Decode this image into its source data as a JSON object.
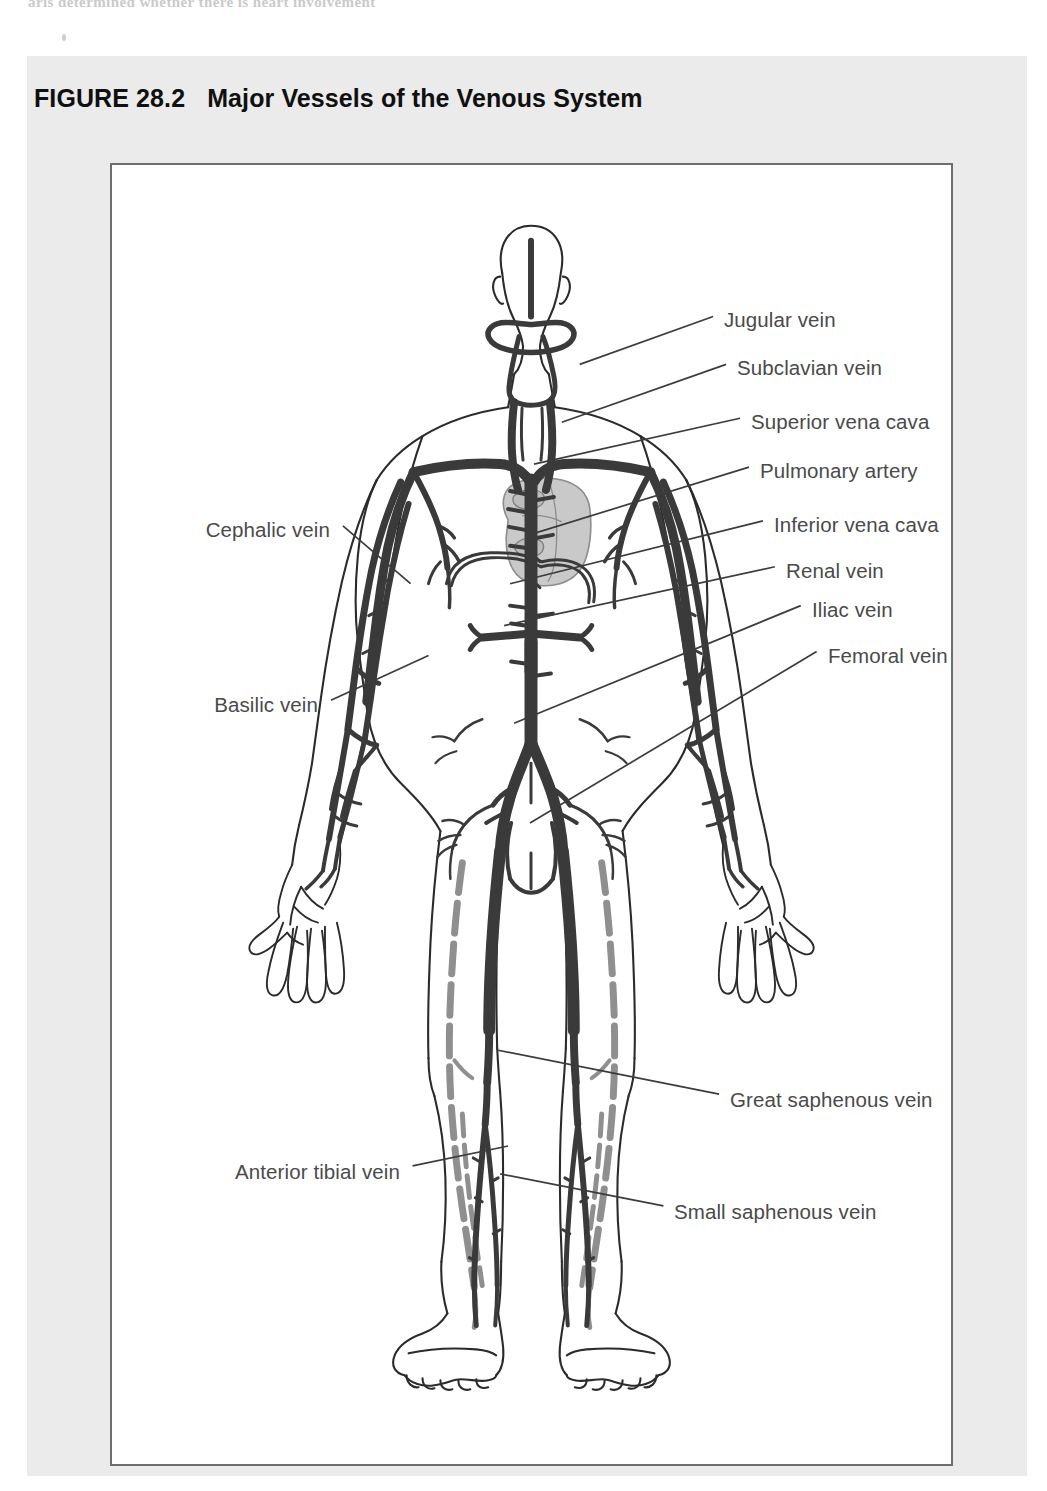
{
  "page": {
    "bleed_text": "aris determined whether there is heart involvement",
    "panel_bg": "#ebebeb",
    "art_bg": "#ffffff",
    "frame_color": "#6e6e6e"
  },
  "figure": {
    "number": "FIGURE 28.2",
    "title": "Major Vessels of the Venous System",
    "title_color": "#101010"
  },
  "diagram": {
    "vein_color": "#3a3a3a",
    "superficial_vein_color": "#8f8f8f",
    "outline_color": "#2b2b2b",
    "heart_fill": "#c9c9c9",
    "leader_color": "#3c3c3c",
    "labels_right": [
      {
        "id": "jugular-vein",
        "text": "Jugular vein",
        "x": 612,
        "y": 158,
        "tx": 470,
        "ty": 200
      },
      {
        "id": "subclavian-vein",
        "text": "Subclavian vein",
        "x": 625,
        "y": 206,
        "tx": 452,
        "ty": 258
      },
      {
        "id": "superior-vena-cava",
        "text": "Superior vena cava",
        "x": 639,
        "y": 260,
        "tx": 424,
        "ty": 300
      },
      {
        "id": "pulmonary-artery",
        "text": "Pulmonary artery",
        "x": 648,
        "y": 309,
        "tx": 416,
        "ty": 372
      },
      {
        "id": "inferior-vena-cava",
        "text": "Inferior vena cava",
        "x": 662,
        "y": 363,
        "tx": 400,
        "ty": 420
      },
      {
        "id": "renal-vein",
        "text": "Renal vein",
        "x": 674,
        "y": 409,
        "tx": 394,
        "ty": 462
      },
      {
        "id": "iliac-vein",
        "text": "Iliac vein",
        "x": 700,
        "y": 448,
        "tx": 404,
        "ty": 560
      },
      {
        "id": "femoral-vein",
        "text": "Femoral vein",
        "x": 716,
        "y": 494,
        "tx": 420,
        "ty": 660
      },
      {
        "id": "great-saphenous-vein",
        "text": "Great saphenous vein",
        "x": 618,
        "y": 938,
        "tx": 388,
        "ty": 888
      },
      {
        "id": "small-saphenous-vein",
        "text": "Small saphenous vein",
        "x": 562,
        "y": 1050,
        "tx": 390,
        "ty": 1012
      }
    ],
    "labels_left": [
      {
        "id": "cephalic-vein",
        "text": "Cephalic vein",
        "x": 222,
        "y": 368,
        "tx": 300,
        "ty": 420
      },
      {
        "id": "basilic-vein",
        "text": "Basilic vein",
        "x": 210,
        "y": 543,
        "tx": 318,
        "ty": 492
      },
      {
        "id": "anterior-tibial-vein",
        "text": "Anterior tibial vein",
        "x": 292,
        "y": 1010,
        "tx": 398,
        "ty": 984
      }
    ]
  }
}
